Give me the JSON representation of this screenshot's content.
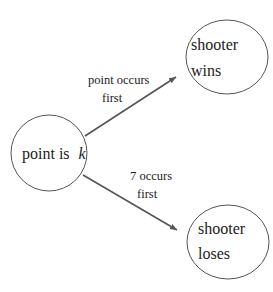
{
  "diagram": {
    "nodes": [
      {
        "id": "point",
        "line1": "point is",
        "var": "k",
        "cx": 49,
        "cy": 153,
        "rx": 38,
        "ry": 38
      },
      {
        "id": "wins",
        "line1": "shooter",
        "line2": "wins",
        "cx": 227,
        "cy": 57,
        "rx": 41,
        "ry": 37
      },
      {
        "id": "loses",
        "line1": "shooter",
        "line2": "loses",
        "cx": 228,
        "cy": 242,
        "rx": 41,
        "ry": 37
      }
    ],
    "edges": [
      {
        "from": "point",
        "to": "wins",
        "label_line1": "point occurs",
        "label_line2": "first"
      },
      {
        "from": "point",
        "to": "loses",
        "label_line1": "7 occurs",
        "label_line2": "first"
      }
    ],
    "colors": {
      "stroke": "#555555",
      "arrow": "#555555",
      "text": "#222222",
      "background": "#ffffff"
    }
  }
}
